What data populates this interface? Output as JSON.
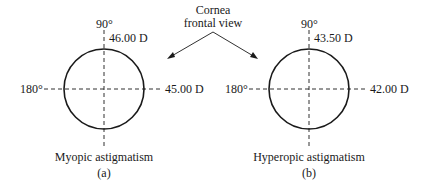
{
  "callout": {
    "line1": "Cornea",
    "line2": "frontal view"
  },
  "panels": [
    {
      "id": "a",
      "top_angle": "90°",
      "left_angle": "180°",
      "vertical_power": "46.00 D",
      "horizontal_power": "45.00 D",
      "caption": "Myopic astigmatism",
      "letter": "(a)"
    },
    {
      "id": "b",
      "top_angle": "90°",
      "left_angle": "180°",
      "vertical_power": "43.50 D",
      "horizontal_power": "42.00 D",
      "caption": "Hyperopic astigmatism",
      "letter": "(b)"
    }
  ],
  "colors": {
    "stroke": "#1a1a1a",
    "background": "#ffffff"
  }
}
